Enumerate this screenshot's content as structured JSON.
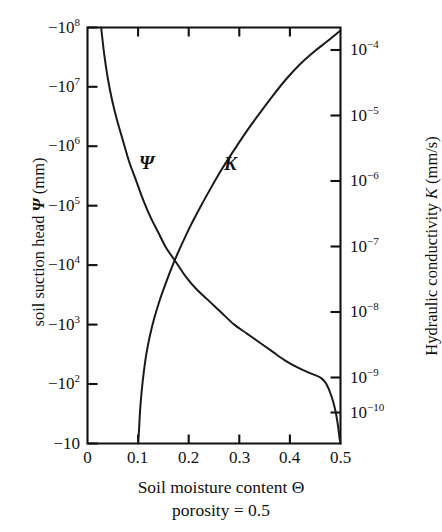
{
  "figure": {
    "background_color": "#ffffff",
    "line_color": "#111111"
  },
  "axes": {
    "left": {
      "title": "soil suction head Ψ (mm)",
      "title_parts": {
        "text": "soil suction head",
        "symbol": "Ψ",
        "unit": "(mm)"
      },
      "tick_labels": [
        "−10",
        "−102",
        "−103",
        "−104",
        "−105",
        "−106",
        "−107",
        "−108"
      ],
      "tick_bases": [
        "−10",
        "−10",
        "−10",
        "−10",
        "−10",
        "−10",
        "−10",
        "−10"
      ],
      "tick_exponents": [
        "",
        "2",
        "3",
        "4",
        "5",
        "6",
        "7",
        "8"
      ],
      "tick_values": [
        -10,
        -100,
        -1000,
        -10000,
        -100000,
        -1000000,
        -10000000,
        -100000000
      ]
    },
    "right": {
      "title": "Hydraulic conductivity K (mm/s)",
      "title_parts": {
        "text": "Hydraulic conductivity",
        "symbol": "K",
        "unit": "(mm/s)"
      },
      "tick_labels": [
        "10−4",
        "10−5",
        "10−6",
        "10−7",
        "10−8",
        "10−9",
        "10−10"
      ],
      "tick_exponents": [
        "−4",
        "−5",
        "−6",
        "−7",
        "−8",
        "−9",
        "−10"
      ],
      "tick_values": [
        0.0001,
        1e-05,
        1e-06,
        1e-07,
        1e-08,
        1e-09,
        1e-10
      ]
    },
    "bottom": {
      "title_line1": "Soil moisture content Θ",
      "title_line2": "porosity = 0.5",
      "tick_labels": [
        "0",
        "0.1",
        "0.2",
        "0.3",
        "0.4",
        "0.5"
      ],
      "tick_values": [
        0,
        0.1,
        0.2,
        0.3,
        0.4,
        0.5
      ]
    }
  },
  "curve_labels": {
    "psi": "Ψ",
    "k": "K"
  },
  "chart_data": {
    "type": "line",
    "title": "",
    "subtitle": "",
    "xlabel": "Soil moisture content Θ, porosity = 0.5",
    "ylabel": "soil suction head Ψ (mm)",
    "y2label": "Hydraulic conductivity K (mm/s)",
    "grid": false,
    "legend": "inline-curve-labels",
    "xlim": [
      0,
      0.5
    ],
    "xticks": [
      0,
      0.1,
      0.2,
      0.3,
      0.4,
      0.5
    ],
    "xticklabels": [
      "0",
      "0.1",
      "0.2",
      "0.3",
      "0.4",
      "0.5"
    ],
    "ylim_log10_abs": [
      1,
      8
    ],
    "yticks_left": [
      -10,
      -100,
      -1000,
      -10000,
      -100000,
      -1000000,
      -10000000,
      -100000000
    ],
    "yticklabels_left": [
      "−10",
      "−10²",
      "−10³",
      "−10⁴",
      "−10⁵",
      "−10⁶",
      "−10⁷",
      "−10⁸"
    ],
    "y2lim_log10": [
      -10.55,
      -3.75
    ],
    "yticks_right": [
      0.0001,
      1e-05,
      1e-06,
      1e-07,
      1e-08,
      1e-09,
      1e-10
    ],
    "yticklabels_right": [
      "10−4",
      "10−5",
      "10−6",
      "10−7",
      "10−8",
      "10−9",
      "10−10"
    ],
    "series": [
      {
        "name": "Ψ",
        "label": "Ψ",
        "axis": "left",
        "units": "mm",
        "description": "Soil suction head versus moisture content; magnitude decreases steeply as moisture increases",
        "points_theta_vs_log10_abs_psi": [
          [
            0.027,
            8.0
          ],
          [
            0.033,
            7.55
          ],
          [
            0.04,
            7.15
          ],
          [
            0.048,
            6.8
          ],
          [
            0.058,
            6.45
          ],
          [
            0.07,
            6.1
          ],
          [
            0.082,
            5.75
          ],
          [
            0.095,
            5.45
          ],
          [
            0.11,
            5.1
          ],
          [
            0.125,
            4.8
          ],
          [
            0.14,
            4.55
          ],
          [
            0.155,
            4.3
          ],
          [
            0.175,
            4.05
          ],
          [
            0.195,
            3.8
          ],
          [
            0.215,
            3.6
          ],
          [
            0.24,
            3.4
          ],
          [
            0.265,
            3.2
          ],
          [
            0.29,
            3.0
          ],
          [
            0.315,
            2.85
          ],
          [
            0.34,
            2.7
          ],
          [
            0.365,
            2.55
          ],
          [
            0.39,
            2.4
          ],
          [
            0.415,
            2.28
          ],
          [
            0.435,
            2.2
          ],
          [
            0.45,
            2.15
          ],
          [
            0.462,
            2.1
          ],
          [
            0.472,
            2.0
          ],
          [
            0.482,
            1.8
          ],
          [
            0.49,
            1.55
          ],
          [
            0.495,
            1.3
          ],
          [
            0.498,
            1.1
          ],
          [
            0.5,
            1.0
          ]
        ]
      },
      {
        "name": "K",
        "label": "K",
        "axis": "right",
        "units": "mm/s",
        "description": "Hydraulic conductivity versus moisture content; increases steeply with moisture",
        "points_theta_vs_log10_k": [
          [
            0.1,
            -10.55
          ],
          [
            0.102,
            -10.3
          ],
          [
            0.104,
            -10.0
          ],
          [
            0.107,
            -9.7
          ],
          [
            0.111,
            -9.4
          ],
          [
            0.116,
            -9.1
          ],
          [
            0.123,
            -8.8
          ],
          [
            0.132,
            -8.5
          ],
          [
            0.143,
            -8.2
          ],
          [
            0.156,
            -7.9
          ],
          [
            0.17,
            -7.6
          ],
          [
            0.186,
            -7.3
          ],
          [
            0.203,
            -7.0
          ],
          [
            0.222,
            -6.7
          ],
          [
            0.242,
            -6.4
          ],
          [
            0.263,
            -6.1
          ],
          [
            0.286,
            -5.8
          ],
          [
            0.31,
            -5.5
          ],
          [
            0.336,
            -5.2
          ],
          [
            0.363,
            -4.9
          ],
          [
            0.392,
            -4.6
          ],
          [
            0.42,
            -4.35
          ],
          [
            0.447,
            -4.15
          ],
          [
            0.47,
            -4.0
          ],
          [
            0.488,
            -3.88
          ],
          [
            0.5,
            -3.8
          ]
        ]
      }
    ]
  }
}
